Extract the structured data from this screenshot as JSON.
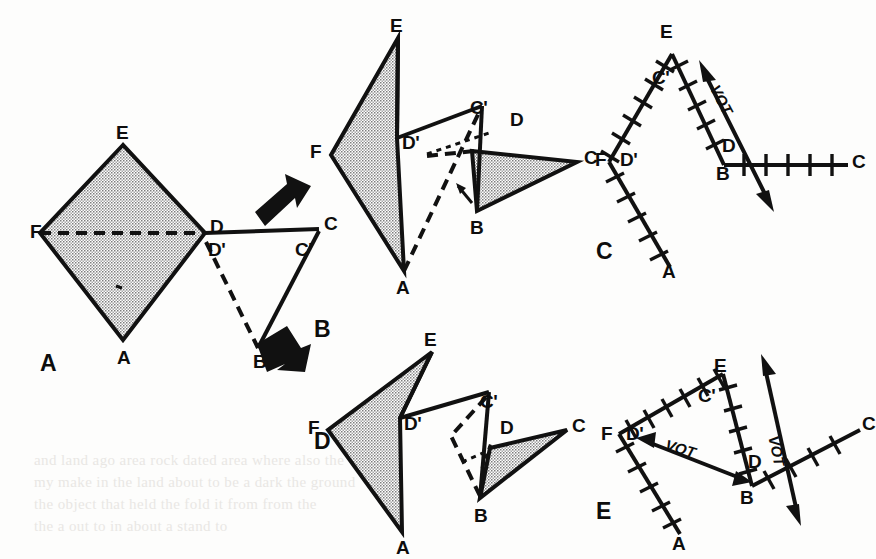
{
  "figure": {
    "width": 876,
    "height": 559,
    "background_color": "#fdfdfc",
    "ink_color": "#111111",
    "shade_color": "#bdbdbd"
  },
  "bleedthrough": {
    "line1": "and land ago area rock dated area where also the",
    "line2": "my make in the land about to be a dark the ground",
    "line3": "the object that held the fold it from from the",
    "line4": "the a out to in about a stand to"
  },
  "panels": [
    {
      "id": "A",
      "letter": "A",
      "letter_pos": [
        40,
        358
      ],
      "vertices": [
        {
          "label": "E",
          "x": 93,
          "y": 45,
          "lx": 86,
          "ly": 23
        },
        {
          "label": "F",
          "x": 10,
          "y": 133,
          "lx": 0,
          "ly": 122
        },
        {
          "label": "D",
          "x": 175,
          "y": 133,
          "lx": 180,
          "ly": 117
        },
        {
          "label": "C",
          "x": 289,
          "y": 129,
          "lx": 294,
          "ly": 114
        },
        {
          "label": "D'",
          "x": 175,
          "y": 146,
          "lx": 178,
          "ly": 140
        },
        {
          "label": "C'",
          "x": 272,
          "y": 147,
          "lx": 265,
          "ly": 140
        },
        {
          "label": "A",
          "x": 93,
          "y": 240,
          "lx": 87,
          "ly": 248
        },
        {
          "label": "B",
          "x": 228,
          "y": 248,
          "lx": 223,
          "ly": 252
        }
      ]
    },
    {
      "id": "B",
      "letter": "B",
      "letter_pos": [
        314,
        318
      ],
      "vertices": [
        {
          "label": "E",
          "x": 84,
          "y": 10,
          "lx": 76,
          "ly": -12
        },
        {
          "label": "F",
          "x": 17,
          "y": 127,
          "lx": 0,
          "ly": 117
        },
        {
          "label": "D'",
          "x": 83,
          "y": 110,
          "lx": 88,
          "ly": 108
        },
        {
          "label": "C'",
          "x": 168,
          "y": 78,
          "lx": 159,
          "ly": 74
        },
        {
          "label": "D",
          "x": 158,
          "y": 123,
          "lx": 196,
          "ly": 93
        },
        {
          "label": "C",
          "x": 263,
          "y": 134,
          "lx": 272,
          "ly": 122
        },
        {
          "label": "A",
          "x": 90,
          "y": 243,
          "lx": 84,
          "ly": 252
        },
        {
          "label": "B",
          "x": 163,
          "y": 183,
          "lx": 158,
          "ly": 192
        }
      ]
    },
    {
      "id": "C",
      "letter": "C",
      "letter_pos": [
        596,
        236
      ],
      "annotation": "VOT",
      "vertices": [
        {
          "label": "E",
          "x": 72,
          "y": 32,
          "lx": 64,
          "ly": 8
        },
        {
          "label": "C'",
          "x": 62,
          "y": 63,
          "lx": 56,
          "ly": 54
        },
        {
          "label": "F",
          "x": 9,
          "y": 140,
          "lx": 0,
          "ly": 130
        },
        {
          "label": "D'",
          "x": 29,
          "y": 140,
          "lx": 24,
          "ly": 130
        },
        {
          "label": "D",
          "x": 130,
          "y": 128,
          "lx": 126,
          "ly": 118
        },
        {
          "label": "B",
          "x": 124,
          "y": 143,
          "lx": 118,
          "ly": 146
        },
        {
          "label": "C",
          "x": 248,
          "y": 143,
          "lx": 254,
          "ly": 130
        },
        {
          "label": "A",
          "x": 70,
          "y": 245,
          "lx": 64,
          "ly": 248
        }
      ]
    },
    {
      "id": "D",
      "letter": "D",
      "letter_pos": [
        314,
        426
      ],
      "vertices": [
        {
          "label": "E",
          "x": 118,
          "y": 32,
          "lx": 110,
          "ly": 10
        },
        {
          "label": "F",
          "x": 14,
          "y": 110,
          "lx": 0,
          "ly": 100
        },
        {
          "label": "D'",
          "x": 86,
          "y": 98,
          "lx": 90,
          "ly": 96
        },
        {
          "label": "C'",
          "x": 175,
          "y": 72,
          "lx": 166,
          "ly": 74
        },
        {
          "label": "D",
          "x": 176,
          "y": 128,
          "lx": 186,
          "ly": 104
        },
        {
          "label": "C",
          "x": 253,
          "y": 110,
          "lx": 258,
          "ly": 98
        },
        {
          "label": "A",
          "x": 88,
          "y": 212,
          "lx": 82,
          "ly": 220
        },
        {
          "label": "B",
          "x": 166,
          "y": 178,
          "lx": 160,
          "ly": 186
        }
      ]
    },
    {
      "id": "E",
      "letter": "E",
      "letter_pos": [
        596,
        498
      ],
      "annotations": [
        "VOT",
        "VOT"
      ],
      "vertices": [
        {
          "label": "E",
          "x": 123,
          "y": 58,
          "lx": 116,
          "ly": 36
        },
        {
          "label": "C'",
          "x": 108,
          "y": 79,
          "lx": 102,
          "ly": 72
        },
        {
          "label": "F",
          "x": 19,
          "y": 118,
          "lx": 8,
          "ly": 108
        },
        {
          "label": "D'",
          "x": 40,
          "y": 122,
          "lx": 34,
          "ly": 112
        },
        {
          "label": "D",
          "x": 157,
          "y": 148,
          "lx": 152,
          "ly": 140
        },
        {
          "label": "B",
          "x": 152,
          "y": 170,
          "lx": 146,
          "ly": 176
        },
        {
          "label": "C",
          "x": 260,
          "y": 114,
          "lx": 266,
          "ly": 102
        },
        {
          "label": "A",
          "x": 80,
          "y": 218,
          "lx": 74,
          "ly": 222
        }
      ]
    }
  ],
  "flow_arrows": [
    {
      "name": "arrow-a-to-b",
      "direction": "up-right"
    },
    {
      "name": "arrow-a-to-d",
      "direction": "down-right"
    }
  ],
  "vot_label": "VOT"
}
